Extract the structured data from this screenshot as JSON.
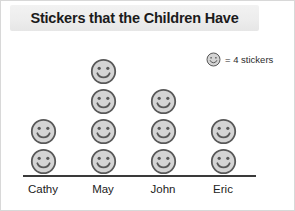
{
  "title": "Stickers that the Children Have",
  "legend": {
    "icon": "smiley-face-icon",
    "text": "= 4 stickers"
  },
  "colors": {
    "face_fill": "#d4d4d4",
    "face_stroke": "#585858",
    "axis": "#3a3a3a",
    "title_bar": "#ededed",
    "text": "#1b1b1b"
  },
  "chart_data": {
    "type": "pictograph",
    "title": "Stickers that the Children Have",
    "xlabel": "",
    "ylabel": "",
    "icon_value": 4,
    "icon_unit": "stickers",
    "legend_label": "= 4 stickers",
    "categories": [
      "Cathy",
      "May",
      "John",
      "Eric"
    ],
    "icon_counts": [
      2,
      4,
      3,
      2
    ],
    "values": [
      8,
      16,
      12,
      8
    ],
    "grid": false,
    "legend_position": "top-right"
  }
}
